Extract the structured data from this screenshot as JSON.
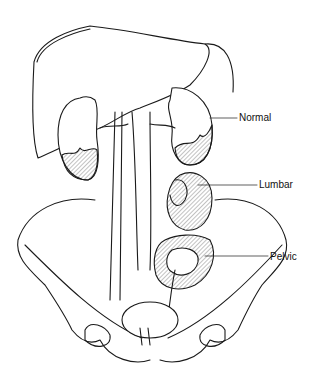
{
  "diagram": {
    "labels": [
      {
        "id": "normal",
        "text": "Normal"
      },
      {
        "id": "lumbar",
        "text": "Lumbar"
      },
      {
        "id": "pelvic",
        "text": "Pelvic"
      }
    ],
    "colors": {
      "line": "#1a1a1a",
      "background": "#ffffff"
    }
  }
}
